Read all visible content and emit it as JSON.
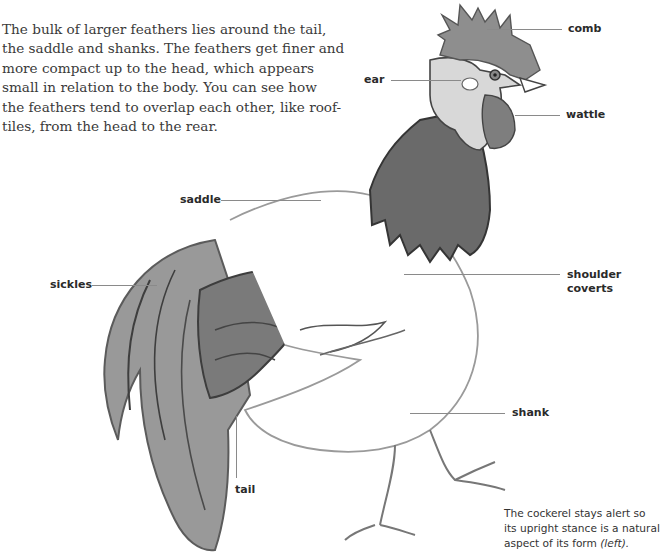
{
  "intro": {
    "lines": [
      "The bulk of larger feathers lies around the tail,",
      "the saddle and shanks. The feathers get finer and",
      "more compact up to the head, which appears",
      "small in relation to the body. You can see how",
      "the feathers tend to overlap each other, like roof-",
      "tiles, from the head to the rear."
    ]
  },
  "labels": {
    "comb": "comb",
    "ear": "ear",
    "wattle": "wattle",
    "saddle": "saddle",
    "sickles": "sickles",
    "shoulder_line1": "shoulder",
    "shoulder_line2": "coverts",
    "shank": "shank",
    "tail": "tail"
  },
  "caption": {
    "line1": "The cockerel stays alert so",
    "line2": "its upright stance is a natural",
    "line3_prefix": "aspect of its form ",
    "line3_italic": "(left)."
  },
  "colors": {
    "text": "#3a3a3a",
    "label": "#2a2a2a",
    "leader": "#8a8a8a",
    "ink_dark": "#4a4a4a",
    "ink_mid": "#6e6e6e",
    "wash_light": "#a9a9a9"
  }
}
